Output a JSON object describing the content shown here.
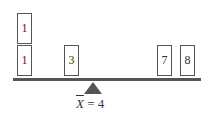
{
  "diagram": {
    "boxes": [
      {
        "value": "1",
        "x": 17,
        "y": 13
      },
      {
        "value": "1",
        "x": 17,
        "y": 45
      },
      {
        "value": "3",
        "x": 64,
        "y": 45
      },
      {
        "value": "7",
        "x": 157,
        "y": 45
      },
      {
        "value": "8",
        "x": 180,
        "y": 45
      }
    ],
    "mean_label": {
      "symbol": "X",
      "equals": " = 4"
    },
    "colors": {
      "beam": "#555555",
      "box_border": "#555555",
      "text": "#333333"
    }
  }
}
